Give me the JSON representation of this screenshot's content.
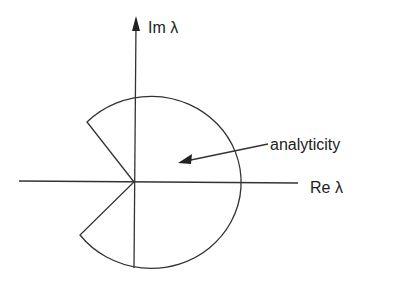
{
  "diagram": {
    "axes": {
      "imag_label": "Im λ",
      "real_label": "Re λ"
    },
    "region_label": "analyticity",
    "colors": {
      "stroke": "#333333",
      "text": "#222222",
      "background": "#ffffff"
    }
  }
}
